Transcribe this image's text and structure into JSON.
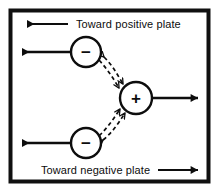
{
  "figure": {
    "border_color": "#101010",
    "background_color": "#ffffff",
    "stroke_color": "#0d0d0d"
  },
  "labels": {
    "top": "Toward positive plate",
    "bottom": "Toward negative plate"
  },
  "charges": [
    {
      "id": "negative-top",
      "sign": "−",
      "cx": 86,
      "cy": 52,
      "r": 15
    },
    {
      "id": "positive-center",
      "sign": "+",
      "cx": 136,
      "cy": 98,
      "r": 16
    },
    {
      "id": "negative-bottom",
      "sign": "−",
      "cx": 86,
      "cy": 143,
      "r": 15
    }
  ],
  "arrows": {
    "top_label_arrow": {
      "direction": "left",
      "from_x": 68,
      "to_x": 25,
      "y": 24
    },
    "negative_top_arrow": {
      "direction": "left",
      "from_x": 71,
      "to_x": 20,
      "y": 52
    },
    "negative_bottom_arrow": {
      "direction": "left",
      "from_x": 71,
      "to_x": 20,
      "y": 143
    },
    "positive_arrow": {
      "direction": "right",
      "from_x": 152,
      "to_x": 200,
      "y": 98
    },
    "bottom_label_arrow": {
      "direction": "right",
      "from_x": 158,
      "to_x": 200,
      "y": 170
    }
  },
  "interaction_arrows": [
    {
      "id": "attraction-upper",
      "style": "dashed",
      "heads": "both",
      "between": [
        "negative-top",
        "positive-center"
      ]
    },
    {
      "id": "attraction-lower",
      "style": "dashed",
      "heads": "both",
      "between": [
        "negative-bottom",
        "positive-center"
      ]
    }
  ]
}
